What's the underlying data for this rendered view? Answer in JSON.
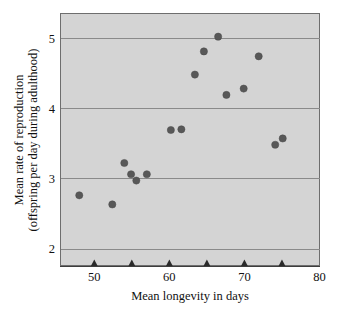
{
  "chart_data": {
    "type": "scatter",
    "title": "",
    "xlabel": "Mean longevity in days",
    "ylabel_line1": "Mean rate of reproduction",
    "ylabel_line2": "(offspring per day during adulthood)",
    "xlim": [
      45.5,
      80
    ],
    "ylim": [
      1.76,
      5.35
    ],
    "xticks": [
      50,
      55,
      60,
      65,
      70,
      75
    ],
    "xtick_labels": [
      "50",
      "",
      "60",
      "",
      "70",
      ""
    ],
    "xticks_labeled": [
      50,
      60,
      70,
      80
    ],
    "xticks_labeled_text": [
      "50",
      "60",
      "70",
      "80"
    ],
    "yticks": [
      2,
      3,
      4,
      5
    ],
    "ytick_labels": [
      "2",
      "3",
      "4",
      "5"
    ],
    "grid": "horizontal",
    "legend": "none",
    "marker": "filled-circle",
    "marker_color": "#585858",
    "plot_background": "#d4d4d4",
    "points": [
      {
        "x": 48.0,
        "y": 2.76
      },
      {
        "x": 52.4,
        "y": 2.63
      },
      {
        "x": 54.0,
        "y": 3.22
      },
      {
        "x": 54.9,
        "y": 3.06
      },
      {
        "x": 55.6,
        "y": 2.97
      },
      {
        "x": 57.0,
        "y": 3.06
      },
      {
        "x": 60.2,
        "y": 3.69
      },
      {
        "x": 61.6,
        "y": 3.7
      },
      {
        "x": 63.4,
        "y": 4.48
      },
      {
        "x": 64.6,
        "y": 4.81
      },
      {
        "x": 66.5,
        "y": 5.02
      },
      {
        "x": 67.6,
        "y": 4.19
      },
      {
        "x": 69.9,
        "y": 4.28
      },
      {
        "x": 71.9,
        "y": 4.74
      },
      {
        "x": 74.1,
        "y": 3.48
      },
      {
        "x": 75.1,
        "y": 3.57
      }
    ]
  }
}
